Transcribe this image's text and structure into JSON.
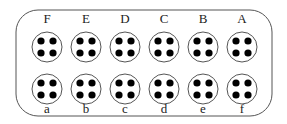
{
  "diagram": {
    "top_labels": [
      "F",
      "E",
      "D",
      "C",
      "B",
      "A"
    ],
    "bottom_labels": [
      "a",
      "b",
      "c",
      "d",
      "e",
      "f"
    ],
    "pins_per_socket": 4,
    "colors": {
      "stroke": "#555555",
      "dot": "#000000",
      "background": "#ffffff"
    }
  }
}
